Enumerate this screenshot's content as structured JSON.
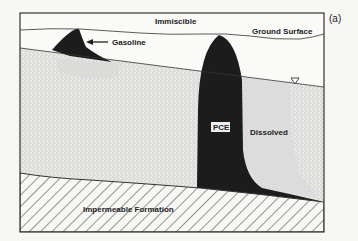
{
  "figure": {
    "panel_label": "(a)",
    "labels": {
      "immiscible": "Immiscible",
      "ground_surface": "Ground Surface",
      "gasoline": "Gasoline",
      "pce": "PCE",
      "dissolved": "Dissolved",
      "impermeable": "Impermeable Formation"
    },
    "symbols": {
      "water_table": "water-table-triangle-icon"
    },
    "colors": {
      "background": "#f7f7f5",
      "frame": "#333333",
      "nonaqueous_phase": "#1c1c1c",
      "dissolved_plume": "#dcdcdc",
      "sand_stipple": "#8a8a8a"
    }
  }
}
